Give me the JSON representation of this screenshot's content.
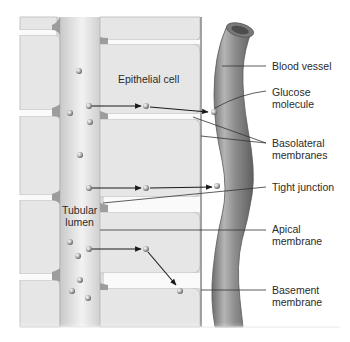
{
  "diagram": {
    "type": "biology-illustration"
  },
  "inner_labels": {
    "epithelial_cell": "Epithelial cell",
    "tubular_lumen": "Tubular\nlumen"
  },
  "callouts": [
    {
      "id": "blood-vessel",
      "text": "Blood vessel"
    },
    {
      "id": "glucose-molecule",
      "text": "Glucose\nmolecule"
    },
    {
      "id": "basolateral-membranes",
      "text": "Basolateral\nmembranes"
    },
    {
      "id": "tight-junction",
      "text": "Tight junction"
    },
    {
      "id": "apical-membrane",
      "text": "Apical\nmembrane"
    },
    {
      "id": "basement-membrane",
      "text": "Basement\nmembrane"
    }
  ],
  "colors": {
    "cell_fill": "#e4e4e4",
    "cell_border": "#c2c2c2",
    "lumen": "#cdcdcd",
    "junction": "#9a9a9a",
    "vessel": "#8a8a8a",
    "leader": "#333333",
    "text": "#2b2b2b"
  }
}
